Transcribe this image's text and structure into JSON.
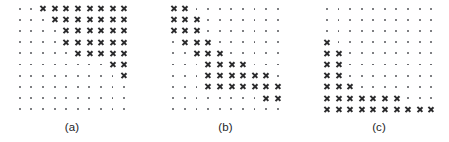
{
  "figure": {
    "marker_symbols": {
      "empty": "dot",
      "filled": "cross"
    },
    "colors": {
      "background": "#ffffff",
      "dot": "#55565a",
      "cross": "#2b2b2d",
      "label": "#1d1d1f"
    },
    "panels": [
      {
        "label": "(a)",
        "name": "panel-a",
        "rows": 10,
        "cols": 10,
        "grid": [
          [
            "dot",
            "dot",
            "cross",
            "cross",
            "cross",
            "cross",
            "cross",
            "cross",
            "cross",
            "cross"
          ],
          [
            "dot",
            "dot",
            "dot",
            "cross",
            "cross",
            "cross",
            "cross",
            "cross",
            "cross",
            "cross"
          ],
          [
            "dot",
            "dot",
            "dot",
            "dot",
            "cross",
            "cross",
            "cross",
            "cross",
            "cross",
            "cross"
          ],
          [
            "dot",
            "dot",
            "dot",
            "dot",
            "cross",
            "cross",
            "cross",
            "cross",
            "cross",
            "cross"
          ],
          [
            "dot",
            "dot",
            "dot",
            "dot",
            "dot",
            "cross",
            "cross",
            "cross",
            "cross",
            "cross"
          ],
          [
            "dot",
            "dot",
            "dot",
            "dot",
            "dot",
            "dot",
            "dot",
            "dot",
            "cross",
            "cross"
          ],
          [
            "dot",
            "dot",
            "dot",
            "dot",
            "dot",
            "dot",
            "dot",
            "dot",
            "dot",
            "cross"
          ],
          [
            "dot",
            "dot",
            "dot",
            "dot",
            "dot",
            "dot",
            "dot",
            "dot",
            "dot",
            "dot"
          ],
          [
            "dot",
            "dot",
            "dot",
            "dot",
            "dot",
            "dot",
            "dot",
            "dot",
            "dot",
            "dot"
          ],
          [
            "dot",
            "dot",
            "dot",
            "dot",
            "dot",
            "dot",
            "dot",
            "dot",
            "dot",
            "dot"
          ]
        ]
      },
      {
        "label": "(b)",
        "name": "panel-b",
        "rows": 10,
        "cols": 10,
        "grid": [
          [
            "cross",
            "cross",
            "dot",
            "dot",
            "dot",
            "dot",
            "dot",
            "dot",
            "dot",
            "dot"
          ],
          [
            "cross",
            "cross",
            "cross",
            "dot",
            "dot",
            "dot",
            "dot",
            "dot",
            "dot",
            "dot"
          ],
          [
            "cross",
            "cross",
            "cross",
            "dot",
            "dot",
            "dot",
            "dot",
            "dot",
            "dot",
            "dot"
          ],
          [
            "dot",
            "cross",
            "cross",
            "cross",
            "dot",
            "dot",
            "dot",
            "dot",
            "dot",
            "dot"
          ],
          [
            "dot",
            "dot",
            "cross",
            "cross",
            "cross",
            "dot",
            "dot",
            "dot",
            "dot",
            "dot"
          ],
          [
            "dot",
            "dot",
            "dot",
            "cross",
            "cross",
            "cross",
            "cross",
            "dot",
            "dot",
            "dot"
          ],
          [
            "dot",
            "dot",
            "dot",
            "cross",
            "cross",
            "cross",
            "cross",
            "cross",
            "cross",
            "dot"
          ],
          [
            "dot",
            "dot",
            "dot",
            "cross",
            "cross",
            "cross",
            "cross",
            "cross",
            "cross",
            "cross"
          ],
          [
            "dot",
            "dot",
            "dot",
            "dot",
            "dot",
            "dot",
            "dot",
            "dot",
            "cross",
            "cross"
          ],
          [
            "dot",
            "dot",
            "dot",
            "dot",
            "dot",
            "dot",
            "dot",
            "dot",
            "dot",
            "dot"
          ]
        ]
      },
      {
        "label": "(c)",
        "name": "panel-c",
        "rows": 10,
        "cols": 10,
        "grid": [
          [
            "dot",
            "dot",
            "dot",
            "dot",
            "dot",
            "dot",
            "dot",
            "dot",
            "dot",
            "dot"
          ],
          [
            "dot",
            "dot",
            "dot",
            "dot",
            "dot",
            "dot",
            "dot",
            "dot",
            "dot",
            "dot"
          ],
          [
            "dot",
            "dot",
            "dot",
            "dot",
            "dot",
            "dot",
            "dot",
            "dot",
            "dot",
            "dot"
          ],
          [
            "cross",
            "dot",
            "dot",
            "dot",
            "dot",
            "dot",
            "dot",
            "dot",
            "dot",
            "dot"
          ],
          [
            "cross",
            "cross",
            "dot",
            "dot",
            "dot",
            "dot",
            "dot",
            "dot",
            "dot",
            "dot"
          ],
          [
            "cross",
            "cross",
            "dot",
            "dot",
            "dot",
            "dot",
            "dot",
            "dot",
            "dot",
            "dot"
          ],
          [
            "cross",
            "cross",
            "dot",
            "dot",
            "dot",
            "dot",
            "dot",
            "dot",
            "dot",
            "dot"
          ],
          [
            "cross",
            "cross",
            "cross",
            "dot",
            "dot",
            "dot",
            "dot",
            "dot",
            "dot",
            "dot"
          ],
          [
            "cross",
            "cross",
            "cross",
            "cross",
            "cross",
            "cross",
            "cross",
            "dot",
            "dot",
            "dot"
          ],
          [
            "cross",
            "cross",
            "cross",
            "cross",
            "cross",
            "cross",
            "cross",
            "cross",
            "cross",
            "cross"
          ]
        ]
      }
    ]
  }
}
